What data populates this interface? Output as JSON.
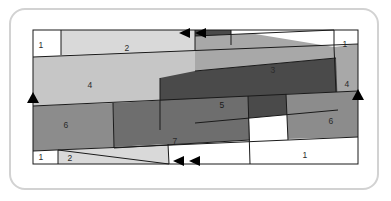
{
  "figure": {
    "type": "tiling-diagram",
    "title": "",
    "frame": {
      "border_color": "#d2d2d2",
      "corner_radius": 16,
      "background": "#ffffff"
    },
    "domain": {
      "outline_color": "#1a1a1a",
      "x": 33,
      "y": 30,
      "width": 325,
      "height": 134
    },
    "palette": {
      "white": "#ffffff",
      "very_light_gray": "#d9d9d9",
      "light_gray": "#c6c6c6",
      "mid_gray": "#a8a8a8",
      "medium_gray": "#8c8c8c",
      "dark_gray": "#6e6e6e",
      "darkest_gray": "#4a4a4a",
      "stroke": "#1a1a1a",
      "marker": "#000000"
    },
    "tiles": [
      {
        "id": "tile-1a",
        "label": "1",
        "fill": "#ffffff",
        "label_x": 41,
        "label_y": 45
      },
      {
        "id": "tile-2a",
        "label": "2",
        "fill": "#d9d9d9",
        "label_x": 127,
        "label_y": 48
      },
      {
        "id": "tile-3",
        "label": "3",
        "fill": "#a8a8a8",
        "label_x": 273,
        "label_y": 70
      },
      {
        "id": "tile-1b",
        "label": "1",
        "fill": "#ffffff",
        "label_x": 345,
        "label_y": 44
      },
      {
        "id": "tile-4a",
        "label": "4",
        "fill": "#c6c6c6",
        "label_x": 90,
        "label_y": 85
      },
      {
        "id": "tile-4b",
        "label": "4",
        "fill": "#a8a8a8",
        "label_x": 357,
        "label_y": 84
      },
      {
        "id": "tile-5",
        "label": "5",
        "fill": "#4a4a4a",
        "label_x": 222,
        "label_y": 105
      },
      {
        "id": "tile-6a",
        "label": "6",
        "fill": "#8c8c8c",
        "label_x": 66,
        "label_y": 125
      },
      {
        "id": "tile-6b",
        "label": "6",
        "fill": "#8c8c8c",
        "label_x": 331,
        "label_y": 121
      },
      {
        "id": "tile-7",
        "label": "7",
        "fill": "#6e6e6e",
        "label_x": 175,
        "label_y": 141
      },
      {
        "id": "tile-1c",
        "label": "1",
        "fill": "#ffffff",
        "label_x": 41,
        "label_y": 157
      },
      {
        "id": "tile-2b",
        "label": "2",
        "fill": "#d9d9d9",
        "label_x": 70,
        "label_y": 158
      },
      {
        "id": "tile-1d",
        "label": "1",
        "fill": "#ffffff",
        "label_x": 305,
        "label_y": 155
      }
    ],
    "markers": [
      {
        "id": "marker-top-left",
        "direction": "left",
        "edge": "top",
        "x": 187,
        "y": 33
      },
      {
        "id": "marker-top-right",
        "direction": "left",
        "edge": "top",
        "x": 203,
        "y": 33
      },
      {
        "id": "marker-bottom-left",
        "direction": "left",
        "edge": "bottom",
        "x": 181,
        "y": 161
      },
      {
        "id": "marker-bottom-right",
        "direction": "left",
        "edge": "bottom",
        "x": 197,
        "y": 161
      },
      {
        "id": "marker-left",
        "direction": "up",
        "edge": "left",
        "x": 33,
        "y": 100
      },
      {
        "id": "marker-right",
        "direction": "up",
        "edge": "right",
        "x": 358,
        "y": 97
      }
    ]
  }
}
